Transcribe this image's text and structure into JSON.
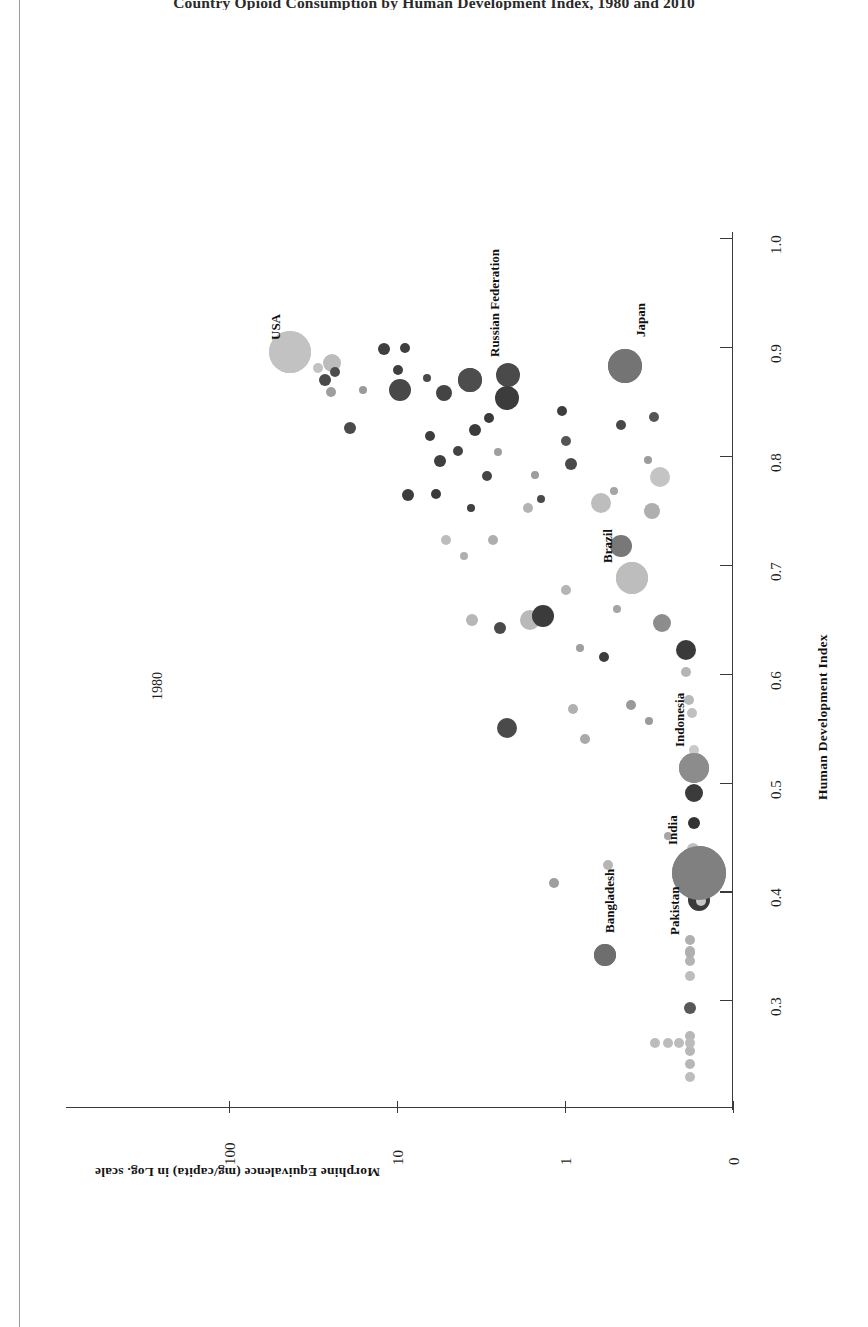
{
  "figure": {
    "title": "Country Opioid Consumption by Human Development Index, 1980 and 2010",
    "year_annotation": "1980"
  },
  "axes": {
    "x": {
      "title": "Human Development Index",
      "ticks": [
        "0.3",
        "0.4",
        "0.5",
        "0.6",
        "0.7",
        "0.8",
        "0.9",
        "1.0"
      ],
      "range": [
        0.25,
        1.05
      ]
    },
    "y": {
      "title": "Morphine Equivalence (mg/capita) in Log. scale",
      "ticks": [
        "0",
        "1",
        "10",
        "100"
      ],
      "scale": "log"
    }
  },
  "countries": [
    {
      "name": "USA",
      "px": 290,
      "py": 352,
      "r": 21,
      "fill": "#c2c2c2",
      "label_x": 268,
      "label_y": 340
    },
    {
      "name": "Russian Federation",
      "px": 470,
      "py": 380,
      "r": 12,
      "fill": "#4d4d4d",
      "label_x": 487,
      "label_y": 357
    },
    {
      "name": "Japan",
      "px": 625,
      "py": 366,
      "r": 17,
      "fill": "#747474",
      "label_x": 633,
      "label_y": 337
    },
    {
      "name": "Brazil",
      "px": 632,
      "py": 578,
      "r": 16,
      "fill": "#bdbdbd",
      "label_x": 600,
      "label_y": 563
    },
    {
      "name": "Indonesia",
      "px": 694,
      "py": 768,
      "r": 15,
      "fill": "#8c8c8c",
      "label_x": 672,
      "label_y": 747
    },
    {
      "name": "India",
      "px": 699,
      "py": 873,
      "r": 27,
      "fill": "#808080",
      "label_x": 665,
      "label_y": 845
    },
    {
      "name": "Bangladesh",
      "px": 605,
      "py": 955,
      "r": 11,
      "fill": "#6e6e6e",
      "label_x": 602,
      "label_y": 933
    },
    {
      "name": "Pakistan",
      "px": 690,
      "py": 953,
      "r": 5,
      "fill": "#b0b0b0",
      "label_x": 667,
      "label_y": 935
    }
  ],
  "chart_data": {
    "type": "scatter",
    "title": "Country Opioid Consumption by Human Development Index, 1980 and 2010",
    "xlabel": "Human Development Index",
    "ylabel": "Morphine Equivalence (mg/capita) in Log. scale",
    "xlim": [
      0.25,
      1.05
    ],
    "xticks": [
      0.3,
      0.4,
      0.5,
      0.6,
      0.7,
      0.8,
      0.9,
      1.0
    ],
    "yticks": [
      0,
      1,
      10,
      100
    ],
    "yscale": "log",
    "grid": false,
    "legend": "none",
    "annotation": "1980",
    "series": [
      {
        "name": "Countries (bubble size = population)",
        "points": [
          {
            "label": "USA",
            "hdi": 0.9,
            "morphine": 25,
            "size": 21,
            "shade": "#c2c2c2"
          },
          {
            "label": "Russian Federation",
            "hdi": 0.85,
            "morphine": 3.6,
            "size": 12,
            "shade": "#4d4d4d"
          },
          {
            "label": "Japan",
            "hdi": 0.89,
            "morphine": 0.62,
            "size": 17,
            "shade": "#747474"
          },
          {
            "label": "Brazil",
            "hdi": 0.68,
            "morphine": 0.46,
            "size": 16,
            "shade": "#bdbdbd"
          },
          {
            "label": "Indonesia",
            "hdi": 0.52,
            "morphine": 0.14,
            "size": 15,
            "shade": "#8c8c8c"
          },
          {
            "label": "India",
            "hdi": 0.43,
            "morphine": 0.12,
            "size": 27,
            "shade": "#808080"
          },
          {
            "label": "Bangladesh",
            "hdi": 0.33,
            "morphine": 0.45,
            "size": 11,
            "shade": "#6e6e6e"
          },
          {
            "label": "Pakistan",
            "hdi": 0.41,
            "morphine": 0.05,
            "size": 5,
            "shade": "#b0b0b0"
          }
        ]
      }
    ]
  },
  "bubbles": [
    {
      "x": 290,
      "y": 352,
      "r": 21,
      "c": "#c2c2c2"
    },
    {
      "x": 332,
      "y": 363,
      "r": 9,
      "c": "#bcbcbc"
    },
    {
      "x": 325,
      "y": 380,
      "r": 6,
      "c": "#4a4a4a"
    },
    {
      "x": 331,
      "y": 392,
      "r": 5,
      "c": "#9e9e9e"
    },
    {
      "x": 350,
      "y": 428,
      "r": 6,
      "c": "#4a4a4a"
    },
    {
      "x": 363,
      "y": 390,
      "r": 4,
      "c": "#9a9a9a"
    },
    {
      "x": 384,
      "y": 349,
      "r": 6,
      "c": "#3f3f3f"
    },
    {
      "x": 398,
      "y": 370,
      "r": 5,
      "c": "#3f3f3f"
    },
    {
      "x": 405,
      "y": 348,
      "r": 5,
      "c": "#3f3f3f"
    },
    {
      "x": 400,
      "y": 390,
      "r": 11,
      "c": "#484848"
    },
    {
      "x": 408,
      "y": 495,
      "r": 6,
      "c": "#3d3d3d"
    },
    {
      "x": 427,
      "y": 378,
      "r": 4,
      "c": "#4a4a4a"
    },
    {
      "x": 430,
      "y": 436,
      "r": 5,
      "c": "#3d3d3d"
    },
    {
      "x": 440,
      "y": 461,
      "r": 6,
      "c": "#3f3f3f"
    },
    {
      "x": 444,
      "y": 393,
      "r": 8,
      "c": "#444444"
    },
    {
      "x": 470,
      "y": 380,
      "r": 12,
      "c": "#4d4d4d"
    },
    {
      "x": 471,
      "y": 508,
      "r": 4,
      "c": "#414141"
    },
    {
      "x": 508,
      "y": 375,
      "r": 12,
      "c": "#4a4a4a"
    },
    {
      "x": 507,
      "y": 398,
      "r": 12,
      "c": "#3c3c3c"
    },
    {
      "x": 487,
      "y": 476,
      "r": 5,
      "c": "#454545"
    },
    {
      "x": 498,
      "y": 452,
      "r": 4,
      "c": "#9f9f9f"
    },
    {
      "x": 493,
      "y": 540,
      "r": 5,
      "c": "#aeaeae"
    },
    {
      "x": 541,
      "y": 499,
      "r": 4,
      "c": "#4a4a4a"
    },
    {
      "x": 528,
      "y": 508,
      "r": 5,
      "c": "#b3b3b3"
    },
    {
      "x": 535,
      "y": 475,
      "r": 4,
      "c": "#9d9d9d"
    },
    {
      "x": 562,
      "y": 411,
      "r": 5,
      "c": "#3d3d3d"
    },
    {
      "x": 566,
      "y": 441,
      "r": 5,
      "c": "#555555"
    },
    {
      "x": 571,
      "y": 464,
      "r": 6,
      "c": "#4a4a4a"
    },
    {
      "x": 601,
      "y": 503,
      "r": 10,
      "c": "#bdbdbd"
    },
    {
      "x": 621,
      "y": 425,
      "r": 5,
      "c": "#484848"
    },
    {
      "x": 614,
      "y": 491,
      "r": 4,
      "c": "#a5a5a5"
    },
    {
      "x": 621,
      "y": 546,
      "r": 11,
      "c": "#787878"
    },
    {
      "x": 632,
      "y": 578,
      "r": 16,
      "c": "#bdbdbd"
    },
    {
      "x": 625,
      "y": 366,
      "r": 17,
      "c": "#747474"
    },
    {
      "x": 652,
      "y": 511,
      "r": 8,
      "c": "#afafaf"
    },
    {
      "x": 654,
      "y": 417,
      "r": 5,
      "c": "#555555"
    },
    {
      "x": 660,
      "y": 477,
      "r": 10,
      "c": "#c4c4c4"
    },
    {
      "x": 648,
      "y": 460,
      "r": 4,
      "c": "#9c9c9c"
    },
    {
      "x": 662,
      "y": 623,
      "r": 9,
      "c": "#8d8d8d"
    },
    {
      "x": 686,
      "y": 650,
      "r": 10,
      "c": "#3a3a3a"
    },
    {
      "x": 686,
      "y": 672,
      "r": 5,
      "c": "#b5b5b5"
    },
    {
      "x": 530,
      "y": 620,
      "r": 10,
      "c": "#b9b9b9"
    },
    {
      "x": 500,
      "y": 628,
      "r": 6,
      "c": "#4a4a4a"
    },
    {
      "x": 543,
      "y": 616,
      "r": 11,
      "c": "#3b3b3b"
    },
    {
      "x": 507,
      "y": 728,
      "r": 10,
      "c": "#4a4a4a"
    },
    {
      "x": 573,
      "y": 709,
      "r": 5,
      "c": "#b0b0b0"
    },
    {
      "x": 585,
      "y": 739,
      "r": 5,
      "c": "#a9a9a9"
    },
    {
      "x": 631,
      "y": 705,
      "r": 5,
      "c": "#999999"
    },
    {
      "x": 689,
      "y": 700,
      "r": 5,
      "c": "#b8b8b8"
    },
    {
      "x": 692,
      "y": 713,
      "r": 5,
      "c": "#c0c0c0"
    },
    {
      "x": 694,
      "y": 768,
      "r": 15,
      "c": "#8c8c8c"
    },
    {
      "x": 694,
      "y": 750,
      "r": 5,
      "c": "#c9c9c9"
    },
    {
      "x": 694,
      "y": 793,
      "r": 9,
      "c": "#3b3b3b"
    },
    {
      "x": 694,
      "y": 823,
      "r": 6,
      "c": "#333333"
    },
    {
      "x": 668,
      "y": 836,
      "r": 4,
      "c": "#a6a6a6"
    },
    {
      "x": 699,
      "y": 873,
      "r": 27,
      "c": "#808080"
    },
    {
      "x": 693,
      "y": 849,
      "r": 6,
      "c": "#c0c0c0"
    },
    {
      "x": 699,
      "y": 900,
      "r": 11,
      "c": "#3a3a3a"
    },
    {
      "x": 701,
      "y": 901,
      "r": 5,
      "c": "#c7c7c7"
    },
    {
      "x": 608,
      "y": 865,
      "r": 5,
      "c": "#b6b6b6"
    },
    {
      "x": 554,
      "y": 883,
      "r": 5,
      "c": "#9e9e9e"
    },
    {
      "x": 605,
      "y": 955,
      "r": 11,
      "c": "#6e6e6e"
    },
    {
      "x": 690,
      "y": 940,
      "r": 5,
      "c": "#b0b0b0"
    },
    {
      "x": 690,
      "y": 951,
      "r": 5,
      "c": "#b4b4b4"
    },
    {
      "x": 690,
      "y": 961,
      "r": 5,
      "c": "#b4b4b4"
    },
    {
      "x": 690,
      "y": 976,
      "r": 5,
      "c": "#bdbdbd"
    },
    {
      "x": 690,
      "y": 1008,
      "r": 6,
      "c": "#585858"
    },
    {
      "x": 690,
      "y": 1036,
      "r": 5,
      "c": "#b7b7b7"
    },
    {
      "x": 690,
      "y": 1051,
      "r": 5,
      "c": "#b7b7b7"
    },
    {
      "x": 690,
      "y": 1064,
      "r": 5,
      "c": "#b7b7b7"
    },
    {
      "x": 690,
      "y": 1077,
      "r": 5,
      "c": "#bdbdbd"
    },
    {
      "x": 668,
      "y": 1043,
      "r": 5,
      "c": "#bcbcbc"
    },
    {
      "x": 679,
      "y": 1043,
      "r": 5,
      "c": "#bcbcbc"
    },
    {
      "x": 690,
      "y": 1043,
      "r": 5,
      "c": "#bcbcbc"
    },
    {
      "x": 655,
      "y": 1043,
      "r": 5,
      "c": "#bcbcbc"
    },
    {
      "x": 472,
      "y": 620,
      "r": 6,
      "c": "#b7b7b7"
    },
    {
      "x": 446,
      "y": 540,
      "r": 5,
      "c": "#bdbdbd"
    },
    {
      "x": 464,
      "y": 556,
      "r": 4,
      "c": "#b0b0b0"
    },
    {
      "x": 436,
      "y": 494,
      "r": 5,
      "c": "#3b3b3b"
    },
    {
      "x": 458,
      "y": 451,
      "r": 5,
      "c": "#444444"
    },
    {
      "x": 475,
      "y": 430,
      "r": 6,
      "c": "#3b3b3b"
    },
    {
      "x": 489,
      "y": 418,
      "r": 5,
      "c": "#3a3a3a"
    },
    {
      "x": 335,
      "y": 372,
      "r": 5,
      "c": "#4d4d4d"
    },
    {
      "x": 318,
      "y": 368,
      "r": 5,
      "c": "#c2c2c2"
    },
    {
      "x": 604,
      "y": 657,
      "r": 5,
      "c": "#3d3d3d"
    },
    {
      "x": 617,
      "y": 609,
      "r": 4,
      "c": "#a5a5a5"
    },
    {
      "x": 580,
      "y": 648,
      "r": 4,
      "c": "#9f9f9f"
    },
    {
      "x": 566,
      "y": 590,
      "r": 5,
      "c": "#b5b5b5"
    },
    {
      "x": 649,
      "y": 721,
      "r": 4,
      "c": "#9a9a9a"
    }
  ]
}
